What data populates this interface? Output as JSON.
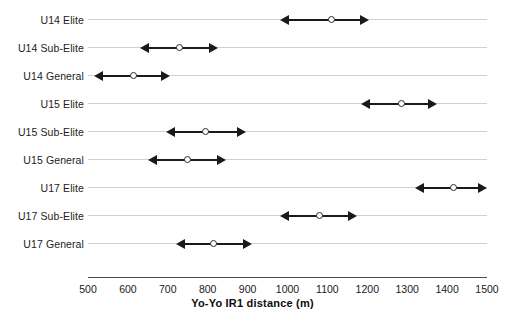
{
  "chart_data": {
    "type": "range",
    "title": "",
    "xlabel": "Yo-Yo IR1 distance (m)",
    "ylabel": "",
    "xlim": [
      500,
      1500
    ],
    "xticks": [
      500,
      600,
      700,
      800,
      900,
      1000,
      1100,
      1200,
      1300,
      1400,
      1500
    ],
    "xtick_labels": [
      "500",
      "600",
      "700",
      "800",
      "900",
      "1000",
      "1100",
      "1200",
      "1300",
      "1400",
      "1500"
    ],
    "grid": true,
    "legend": "none",
    "categories": [
      "U14 Elite",
      "U14 Sub-Elite",
      "U14 General",
      "U15 Elite",
      "U15 Sub-Elite",
      "U15 General",
      "U17 Elite",
      "U17 Sub-Elite",
      "U17 General"
    ],
    "series": [
      {
        "name": "Yo-Yo IR1 distance",
        "points": [
          {
            "category": "U14 Elite",
            "value": 1110,
            "low": 980,
            "high": 1205
          },
          {
            "category": "U14 Sub-Elite",
            "value": 730,
            "low": 630,
            "high": 825
          },
          {
            "category": "U14 General",
            "value": 615,
            "low": 515,
            "high": 705
          },
          {
            "category": "U15 Elite",
            "value": 1285,
            "low": 1185,
            "high": 1375
          },
          {
            "category": "U15 Sub-Elite",
            "value": 795,
            "low": 695,
            "high": 895
          },
          {
            "category": "U15 General",
            "value": 750,
            "low": 650,
            "high": 845
          },
          {
            "category": "U17 Elite",
            "value": 1415,
            "low": 1320,
            "high": 1500
          },
          {
            "category": "U17 Sub-Elite",
            "value": 1080,
            "low": 980,
            "high": 1175
          },
          {
            "category": "U17 General",
            "value": 815,
            "low": 720,
            "high": 910
          }
        ]
      }
    ],
    "colors": {
      "line": "#1a1a1a",
      "marker_fill": "#ffffff",
      "marker_stroke": "#2b2b2b",
      "gridline": "#cfcfcf",
      "axis": "#4a4a4a",
      "text": "#1a1a1a",
      "background": "#ffffff"
    }
  },
  "layout": {
    "plot_left_px": 88,
    "plot_right_px": 487,
    "first_row_y_px": 10,
    "row_step_px": 28,
    "axis_y_px": 277
  }
}
